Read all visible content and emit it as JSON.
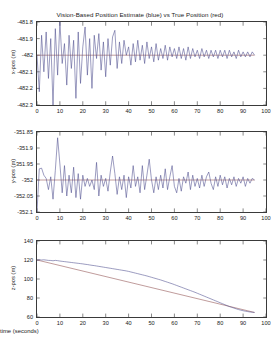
{
  "figure": {
    "title": "Vision-Based Position Estimate (blue) vs True Position (red)",
    "background": "#ffffff",
    "axis_color": "#3a3a3a",
    "estimate_color": "#4a4a8c",
    "truth_color": "#8c4a4a"
  },
  "chart_data": [
    {
      "type": "line",
      "panel": "x-position",
      "title": "Vision-Based Position Estimate (blue) vs True Position (red)",
      "xlabel": "",
      "ylabel": "x-pos (m)",
      "xlim": [
        0,
        100
      ],
      "ylim": [
        -482.3,
        -481.8
      ],
      "xticks": [
        0,
        10,
        20,
        30,
        40,
        50,
        60,
        70,
        80,
        90,
        100
      ],
      "yticks": [
        -481.8,
        -481.9,
        -482,
        -482.1,
        -482.2,
        -482.3
      ],
      "ytick_labels": [
        "-481.8",
        "-481.9",
        "-482",
        "-482.1",
        "-482.2",
        "-482.3"
      ],
      "grid": false,
      "legend": "in-title",
      "series": [
        {
          "name": "Vision-Based Position Estimate (blue)",
          "color": "#4a4a8c",
          "x": [
            0,
            1,
            2,
            3,
            4,
            5,
            6,
            7,
            8,
            9,
            10,
            11,
            12,
            13,
            14,
            15,
            16,
            17,
            18,
            19,
            20,
            21,
            22,
            23,
            24,
            25,
            26,
            27,
            28,
            29,
            30,
            31,
            32,
            33,
            34,
            35,
            36,
            37,
            38,
            39,
            40,
            41,
            42,
            43,
            44,
            45,
            46,
            47,
            48,
            49,
            50,
            51,
            52,
            53,
            54,
            55,
            56,
            57,
            58,
            59,
            60,
            61,
            62,
            63,
            64,
            65,
            66,
            67,
            68,
            69,
            70,
            71,
            72,
            73,
            74,
            75,
            76,
            77,
            78,
            79,
            80,
            81,
            82,
            83,
            84,
            85,
            86,
            87,
            88,
            89,
            90,
            91,
            92,
            93,
            94,
            95
          ],
          "values": [
            -482.0,
            -482.22,
            -481.88,
            -482.1,
            -481.86,
            -482.14,
            -481.9,
            -482.3,
            -481.84,
            -482.12,
            -481.8,
            -482.05,
            -481.93,
            -482.18,
            -481.88,
            -482.08,
            -481.91,
            -482.26,
            -481.86,
            -482.17,
            -481.95,
            -481.83,
            -482.12,
            -481.9,
            -482.2,
            -481.88,
            -482.02,
            -481.87,
            -482.09,
            -481.92,
            -482.13,
            -481.9,
            -482.06,
            -481.89,
            -481.85,
            -482.08,
            -481.92,
            -482.05,
            -481.91,
            -482.0,
            -481.95,
            -482.06,
            -481.93,
            -482.04,
            -481.91,
            -482.03,
            -481.94,
            -482.05,
            -481.92,
            -482.02,
            -481.95,
            -482.04,
            -481.93,
            -482.03,
            -481.96,
            -482.02,
            -481.94,
            -482.03,
            -481.95,
            -482.01,
            -481.96,
            -482.02,
            -481.95,
            -482.02,
            -481.96,
            -482.03,
            -481.95,
            -482.02,
            -481.96,
            -482.01,
            -481.97,
            -482.02,
            -481.96,
            -482.01,
            -481.97,
            -482.02,
            -481.97,
            -482.01,
            -481.97,
            -482.02,
            -481.97,
            -482.01,
            -481.97,
            -482.02,
            -481.97,
            -482.01,
            -481.98,
            -482.02,
            -481.97,
            -482.01,
            -481.98,
            -482.01,
            -481.98,
            -482.01,
            -481.98,
            -482.0
          ]
        },
        {
          "name": "True Position (red)",
          "color": "#8c4a4a",
          "x": [
            0,
            95
          ],
          "values": [
            -482.0,
            -482.0
          ]
        }
      ]
    },
    {
      "type": "line",
      "panel": "y-position",
      "title": "",
      "xlabel": "",
      "ylabel": "y-pos (m)",
      "xlim": [
        0,
        100
      ],
      "ylim": [
        -352.1,
        -351.85
      ],
      "xticks": [
        0,
        10,
        20,
        30,
        40,
        50,
        60,
        70,
        80,
        90,
        100
      ],
      "yticks": [
        -351.85,
        -351.9,
        -351.95,
        -352,
        -352.05,
        -352.1
      ],
      "ytick_labels": [
        "-351.85",
        "-351.9",
        "-351.95",
        "-352",
        "-352.05",
        "-352.1"
      ],
      "grid": false,
      "series": [
        {
          "name": "Vision-Based Position Estimate (blue)",
          "color": "#4a4a8c",
          "x": [
            0,
            1,
            2,
            3,
            4,
            5,
            6,
            7,
            8,
            9,
            10,
            11,
            12,
            13,
            14,
            15,
            16,
            17,
            18,
            19,
            20,
            21,
            22,
            23,
            24,
            25,
            26,
            27,
            28,
            29,
            30,
            31,
            32,
            33,
            34,
            35,
            36,
            37,
            38,
            39,
            40,
            41,
            42,
            43,
            44,
            45,
            46,
            47,
            48,
            49,
            50,
            51,
            52,
            53,
            54,
            55,
            56,
            57,
            58,
            59,
            60,
            61,
            62,
            63,
            64,
            65,
            66,
            67,
            68,
            69,
            70,
            71,
            72,
            73,
            74,
            75,
            76,
            77,
            78,
            79,
            80,
            81,
            82,
            83,
            84,
            85,
            86,
            87,
            88,
            89,
            90,
            91,
            92,
            93,
            94,
            95
          ],
          "values": [
            -352.1,
            -351.965,
            -351.963,
            -351.985,
            -351.995,
            -352.03,
            -351.99,
            -352.06,
            -351.97,
            -351.868,
            -351.95,
            -352.04,
            -351.955,
            -352.05,
            -351.985,
            -352.04,
            -351.96,
            -352.055,
            -351.98,
            -352.06,
            -351.985,
            -352.02,
            -351.995,
            -352.02,
            -352.0,
            -352.03,
            -351.945,
            -352.05,
            -351.985,
            -352.02,
            -351.995,
            -352.035,
            -351.975,
            -351.925,
            -351.98,
            -352.045,
            -351.99,
            -352.03,
            -351.985,
            -352.055,
            -351.99,
            -352.025,
            -351.955,
            -352.02,
            -351.99,
            -352.04,
            -351.955,
            -352.03,
            -351.985,
            -351.935,
            -352.0,
            -352.04,
            -351.99,
            -352.03,
            -351.985,
            -352.025,
            -351.965,
            -352.03,
            -351.99,
            -351.955,
            -352.02,
            -352.04,
            -351.995,
            -352.035,
            -351.99,
            -352.01,
            -351.975,
            -352.03,
            -351.985,
            -352.02,
            -351.995,
            -352.025,
            -351.985,
            -352.02,
            -351.99,
            -351.975,
            -352.01,
            -352.03,
            -351.99,
            -352.02,
            -351.985,
            -352.015,
            -351.99,
            -352.025,
            -351.995,
            -352.015,
            -351.99,
            -352.02,
            -351.995,
            -352.01,
            -351.99,
            -352.02,
            -351.995,
            -352.01,
            -351.995,
            -352.0
          ]
        },
        {
          "name": "True Position (red)",
          "color": "#8c4a4a",
          "x": [
            0,
            95
          ],
          "values": [
            -352.0,
            -352.0
          ]
        }
      ]
    },
    {
      "type": "line",
      "panel": "z-position",
      "title": "",
      "xlabel": "time (seconds)",
      "ylabel": "z-pos (m)",
      "xlim": [
        0,
        100
      ],
      "ylim": [
        60,
        140
      ],
      "xticks": [
        0,
        10,
        20,
        30,
        40,
        50,
        60,
        70,
        80,
        90,
        100
      ],
      "yticks": [
        60,
        80,
        100,
        120,
        140
      ],
      "ytick_labels": [
        "60",
        "80",
        "100",
        "120",
        "140"
      ],
      "grid": false,
      "series": [
        {
          "name": "Vision-Based Position Estimate (blue)",
          "color": "#4a4a8c",
          "x": [
            0,
            1,
            2,
            3,
            4,
            5,
            6,
            7,
            8,
            9,
            10,
            11,
            12,
            13,
            14,
            15,
            16,
            17,
            18,
            19,
            20,
            21,
            22,
            23,
            24,
            25,
            26,
            27,
            28,
            29,
            30,
            31,
            32,
            33,
            34,
            35,
            36,
            37,
            38,
            39,
            40,
            41,
            42,
            43,
            44,
            45,
            46,
            47,
            48,
            49,
            50,
            51,
            52,
            53,
            54,
            55,
            56,
            57,
            58,
            59,
            60,
            61,
            62,
            63,
            64,
            65,
            66,
            67,
            68,
            69,
            70,
            71,
            72,
            73,
            74,
            75,
            76,
            77,
            78,
            79,
            80,
            81,
            82,
            83,
            84,
            85,
            86,
            87,
            88,
            89,
            90,
            91,
            92,
            93,
            94,
            95
          ],
          "values": [
            119.8,
            120.3,
            120.0,
            120.2,
            119.9,
            119.6,
            119.5,
            119.2,
            119.6,
            119.3,
            118.9,
            118.6,
            118.3,
            118.0,
            117.7,
            117.4,
            117.1,
            116.8,
            116.5,
            116.2,
            115.9,
            115.5,
            115.2,
            114.8,
            114.4,
            114.1,
            113.7,
            113.3,
            112.9,
            112.5,
            112.1,
            111.7,
            111.3,
            110.9,
            110.5,
            110.1,
            109.7,
            109.3,
            108.9,
            108.5,
            108.0,
            107.4,
            106.8,
            106.2,
            105.6,
            105.0,
            104.4,
            103.8,
            103.2,
            102.5,
            101.8,
            101.1,
            100.4,
            99.7,
            99.0,
            98.2,
            97.4,
            96.6,
            95.8,
            95.0,
            94.1,
            93.2,
            92.3,
            91.4,
            90.5,
            89.6,
            88.7,
            87.8,
            86.9,
            86.0,
            85.0,
            84.0,
            83.0,
            82.0,
            81.0,
            80.0,
            79.0,
            78.0,
            77.0,
            76.0,
            75.0,
            74.0,
            73.0,
            72.0,
            71.0,
            70.2,
            69.4,
            68.6,
            67.8,
            67.2,
            66.6,
            66.1,
            65.7,
            65.3,
            65.0,
            64.8
          ]
        },
        {
          "name": "True Position (red)",
          "color": "#8c4a4a",
          "x": [
            0,
            95
          ],
          "values": [
            120.0,
            64.8
          ]
        }
      ]
    }
  ]
}
